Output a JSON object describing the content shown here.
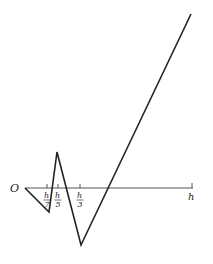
{
  "diagram": {
    "origin_label": "O",
    "axis_end_label": "h",
    "ticks": [
      {
        "num": "h",
        "den": "7",
        "x": 47
      },
      {
        "num": "h",
        "den": "5",
        "x": 58
      },
      {
        "num": "h",
        "den": "3",
        "x": 80
      },
      {
        "num": "h",
        "den": "",
        "x": 192
      }
    ],
    "axis": {
      "x1": 25,
      "x2": 193,
      "y": 188
    },
    "polyline_points": [
      [
        25,
        188
      ],
      [
        49,
        212
      ],
      [
        57,
        152
      ],
      [
        81,
        245
      ],
      [
        191,
        14
      ]
    ],
    "line_color": "#222222"
  }
}
